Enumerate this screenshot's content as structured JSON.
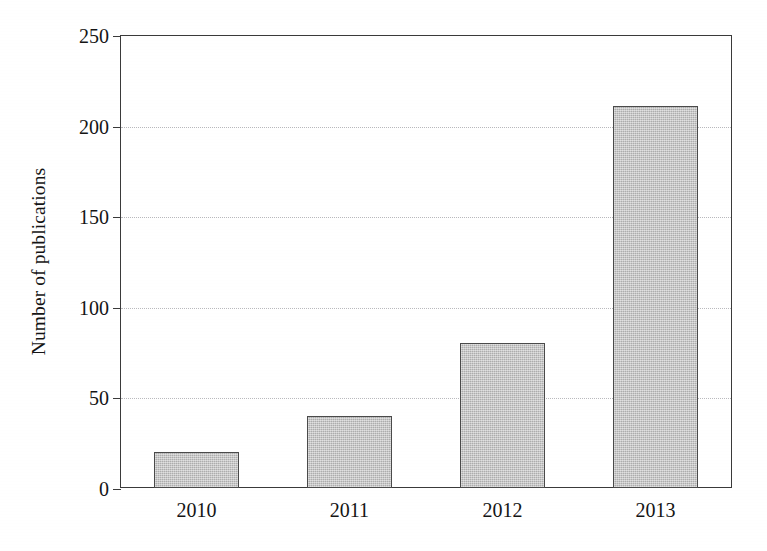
{
  "chart_data": {
    "type": "bar",
    "title": "",
    "xlabel": "",
    "ylabel": "Number of publications",
    "categories": [
      "2010",
      "2011",
      "2012",
      "2013"
    ],
    "values": [
      20,
      40,
      80,
      211
    ],
    "ylim": [
      0,
      250
    ],
    "yticks": [
      0,
      50,
      100,
      150,
      200,
      250
    ],
    "ytick_labels": [
      "0",
      "50",
      "100",
      "150",
      "200",
      "250"
    ],
    "gridlines_at": [
      50,
      100,
      150,
      200
    ],
    "grid": true,
    "legend": null,
    "bar_fill_color": "#bcbcbc",
    "bar_edge_color": "#4a4a4a",
    "axis_color": "#3a3a3a",
    "grid_color": "#b9b9bd",
    "background_color": "#ffffff"
  }
}
